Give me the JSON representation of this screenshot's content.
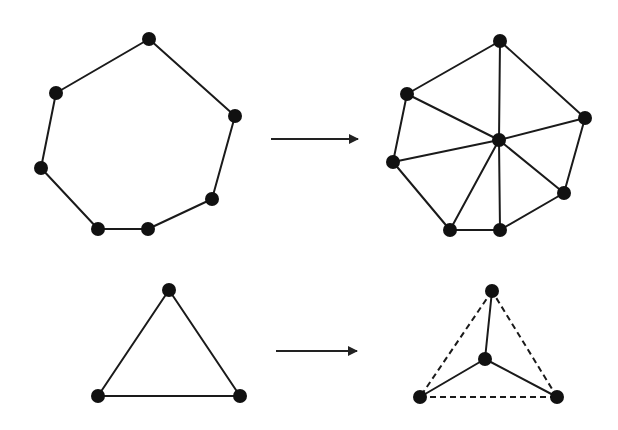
{
  "figure": {
    "width": 618,
    "height": 430,
    "colors": {
      "ink": "#111111",
      "edge": "#1a1a1a",
      "background": "#ffffff"
    },
    "node_radius": 7
  },
  "panels": [
    {
      "id": "heptagon-before",
      "nodes": [
        [
          149,
          39
        ],
        [
          56,
          93
        ],
        [
          41,
          168
        ],
        [
          98,
          229
        ],
        [
          148,
          229
        ],
        [
          212,
          199
        ],
        [
          235,
          116
        ]
      ],
      "edges": [
        [
          0,
          1,
          "solid"
        ],
        [
          1,
          2,
          "solid"
        ],
        [
          2,
          3,
          "solid"
        ],
        [
          3,
          4,
          "solid"
        ],
        [
          4,
          5,
          "solid"
        ],
        [
          5,
          6,
          "solid"
        ],
        [
          6,
          0,
          "solid"
        ]
      ]
    },
    {
      "id": "heptagon-after",
      "nodes": [
        [
          500,
          41
        ],
        [
          407,
          94
        ],
        [
          393,
          162
        ],
        [
          450,
          230
        ],
        [
          500,
          230
        ],
        [
          564,
          193
        ],
        [
          585,
          118
        ],
        [
          499,
          140
        ]
      ],
      "edges": [
        [
          0,
          1,
          "solid"
        ],
        [
          1,
          2,
          "solid"
        ],
        [
          2,
          3,
          "solid"
        ],
        [
          3,
          4,
          "solid"
        ],
        [
          4,
          5,
          "solid"
        ],
        [
          5,
          6,
          "solid"
        ],
        [
          6,
          0,
          "solid"
        ],
        [
          7,
          0,
          "solid"
        ],
        [
          7,
          1,
          "solid"
        ],
        [
          7,
          2,
          "solid"
        ],
        [
          7,
          3,
          "solid"
        ],
        [
          7,
          4,
          "solid"
        ],
        [
          7,
          5,
          "solid"
        ],
        [
          7,
          6,
          "solid"
        ]
      ]
    },
    {
      "id": "triangle-before",
      "nodes": [
        [
          169,
          290
        ],
        [
          98,
          396
        ],
        [
          240,
          396
        ]
      ],
      "edges": [
        [
          0,
          1,
          "solid"
        ],
        [
          1,
          2,
          "solid"
        ],
        [
          2,
          0,
          "solid"
        ]
      ]
    },
    {
      "id": "triangle-after",
      "nodes": [
        [
          492,
          291
        ],
        [
          420,
          397
        ],
        [
          557,
          397
        ],
        [
          485,
          359
        ]
      ],
      "edges": [
        [
          0,
          1,
          "dashed"
        ],
        [
          1,
          2,
          "dashed"
        ],
        [
          2,
          0,
          "dashed"
        ],
        [
          3,
          0,
          "solid"
        ],
        [
          3,
          1,
          "solid"
        ],
        [
          3,
          2,
          "solid"
        ]
      ]
    }
  ],
  "arrows": [
    {
      "id": "arrow-top",
      "from": [
        271,
        139
      ],
      "to": [
        358,
        139
      ]
    },
    {
      "id": "arrow-bottom",
      "from": [
        276,
        351
      ],
      "to": [
        357,
        351
      ]
    }
  ]
}
